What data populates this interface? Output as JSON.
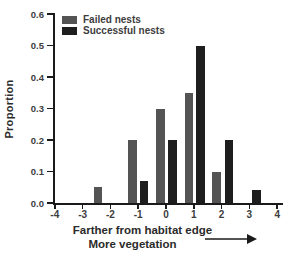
{
  "figure": {
    "background": "#ffffff",
    "axis_color": "#1a1a1a"
  },
  "chart_data": {
    "type": "bar",
    "title": "",
    "ylabel": "Proportion",
    "xlabel_line1": "Farther from habitat edge",
    "xlabel_line2": "More vegetation",
    "xlabel_arrow": "right-arrow",
    "xlim": [
      -4,
      4
    ],
    "ylim": [
      0,
      0.6
    ],
    "x_ticks": [
      -4,
      -3,
      -2,
      -1,
      0,
      1,
      2,
      3,
      4
    ],
    "y_ticks": [
      0.0,
      0.1,
      0.2,
      0.3,
      0.4,
      0.5,
      0.6
    ],
    "grid": false,
    "legend_position": "top-left-inside",
    "legend": [
      {
        "label": "Failed nests",
        "color": "#545454"
      },
      {
        "label": "Successful nests",
        "color": "#1e1e1e"
      }
    ],
    "bar_width_units": 0.31,
    "bars": [
      {
        "series": "Failed nests",
        "x": -2.44,
        "value": 0.05
      },
      {
        "series": "Failed nests",
        "x": -1.2,
        "value": 0.2
      },
      {
        "series": "Successful nests",
        "x": -0.79,
        "value": 0.07
      },
      {
        "series": "Failed nests",
        "x": -0.19,
        "value": 0.3
      },
      {
        "series": "Successful nests",
        "x": 0.23,
        "value": 0.2
      },
      {
        "series": "Failed nests",
        "x": 0.83,
        "value": 0.35
      },
      {
        "series": "Successful nests",
        "x": 1.25,
        "value": 0.5
      },
      {
        "series": "Failed nests",
        "x": 1.82,
        "value": 0.1
      },
      {
        "series": "Successful nests",
        "x": 2.27,
        "value": 0.2
      },
      {
        "series": "Successful nests",
        "x": 3.26,
        "value": 0.04
      }
    ],
    "grouped_by_bin": {
      "categories": [
        -2,
        -1,
        0,
        1,
        2,
        3
      ],
      "series": [
        {
          "name": "Failed nests",
          "values": [
            0.05,
            0.2,
            0.3,
            0.35,
            0.1,
            0
          ]
        },
        {
          "name": "Successful nests",
          "values": [
            0,
            0.07,
            0.2,
            0.5,
            0.2,
            0.04
          ]
        }
      ]
    }
  }
}
